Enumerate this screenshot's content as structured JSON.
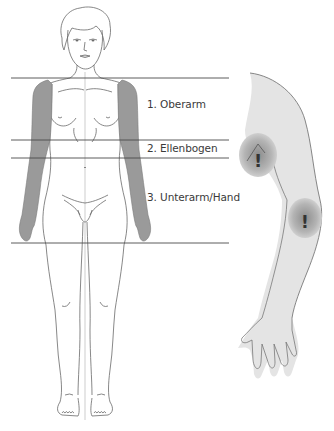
{
  "diagram": {
    "type": "anatomical-zones",
    "regions": [
      {
        "id": "upper-arm",
        "label": "1. Oberarm",
        "y_top": 78,
        "y_bottom": 140
      },
      {
        "id": "elbow",
        "label": "2. Ellenbogen",
        "y_top": 140,
        "y_bottom": 158
      },
      {
        "id": "forearm-hand",
        "label": "3. Unterarm/Hand",
        "y_top": 158,
        "y_bottom": 243
      }
    ],
    "markers": [
      {
        "id": "elbow-marker",
        "symbol": "!",
        "cx": 258,
        "cy": 155
      },
      {
        "id": "forearm-marker",
        "symbol": "!",
        "cx": 305,
        "cy": 218
      }
    ],
    "colors": {
      "background": "#ffffff",
      "zone_lines": "#4a4a4a",
      "arm_shading": "#9a9a9a",
      "body_outline": "#6a6a6a",
      "side_arm_fill": "#e4e4e4",
      "marker_fill": "#a8a8a8",
      "label_text": "#3a3a3a"
    }
  }
}
